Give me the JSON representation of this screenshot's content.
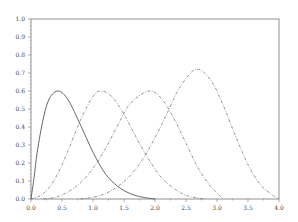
{
  "chart_data": {
    "type": "line",
    "title": "",
    "xlabel": "",
    "ylabel": "",
    "xlim": [
      0.0,
      4.0
    ],
    "ylim": [
      0.0,
      1.0
    ],
    "grid": false,
    "legend": null,
    "x_ticks": [
      "0.0",
      "0.5",
      "1.0",
      "1.5",
      "2.0",
      "2.5",
      "3.0",
      "3.5",
      "4.0"
    ],
    "y_ticks": [
      "0.0",
      "0.1",
      "0.2",
      "0.3",
      "0.4",
      "0.5",
      "0.6",
      "0.7",
      "0.8",
      "0.9",
      "1.0"
    ],
    "series": [
      {
        "name": "curve-1",
        "style": "solid",
        "color": "#555555",
        "x": [
          0.0,
          0.05,
          0.1,
          0.2,
          0.3,
          0.44,
          0.6,
          0.8,
          1.0,
          1.2,
          1.4,
          1.6,
          1.8,
          2.0
        ],
        "y": [
          0.0,
          0.12,
          0.26,
          0.45,
          0.56,
          0.6,
          0.55,
          0.41,
          0.26,
          0.14,
          0.07,
          0.03,
          0.01,
          0.0
        ]
      },
      {
        "name": "curve-2",
        "style": "dashdot",
        "color": "#666666",
        "x": [
          0.0,
          0.2,
          0.4,
          0.6,
          0.8,
          1.0,
          1.13,
          1.3,
          1.5,
          1.7,
          1.9,
          2.1,
          2.3,
          2.5,
          2.8
        ],
        "y": [
          0.0,
          0.03,
          0.12,
          0.27,
          0.44,
          0.57,
          0.6,
          0.57,
          0.47,
          0.34,
          0.22,
          0.12,
          0.06,
          0.02,
          0.0
        ]
      },
      {
        "name": "curve-3",
        "style": "dashdot",
        "color": "#666666",
        "x": [
          0.2,
          0.4,
          0.6,
          0.8,
          1.0,
          1.2,
          1.4,
          1.6,
          1.9,
          2.1,
          2.3,
          2.5,
          2.7,
          2.9,
          3.1
        ],
        "y": [
          0.0,
          0.01,
          0.04,
          0.09,
          0.17,
          0.28,
          0.41,
          0.53,
          0.6,
          0.56,
          0.45,
          0.31,
          0.17,
          0.07,
          0.0
        ]
      },
      {
        "name": "curve-4",
        "style": "dashdot",
        "color": "#666666",
        "x": [
          0.8,
          1.0,
          1.2,
          1.4,
          1.6,
          1.8,
          2.0,
          2.2,
          2.4,
          2.66,
          2.9,
          3.1,
          3.3,
          3.5,
          3.7,
          3.9,
          4.0
        ],
        "y": [
          0.0,
          0.01,
          0.03,
          0.07,
          0.13,
          0.22,
          0.34,
          0.48,
          0.62,
          0.72,
          0.66,
          0.52,
          0.35,
          0.19,
          0.08,
          0.02,
          0.0
        ]
      }
    ]
  },
  "plot_area": {
    "left": 31,
    "right": 279,
    "top": 19,
    "bottom": 199
  },
  "colors": {
    "axis": "#555555",
    "curve": "#555555"
  }
}
